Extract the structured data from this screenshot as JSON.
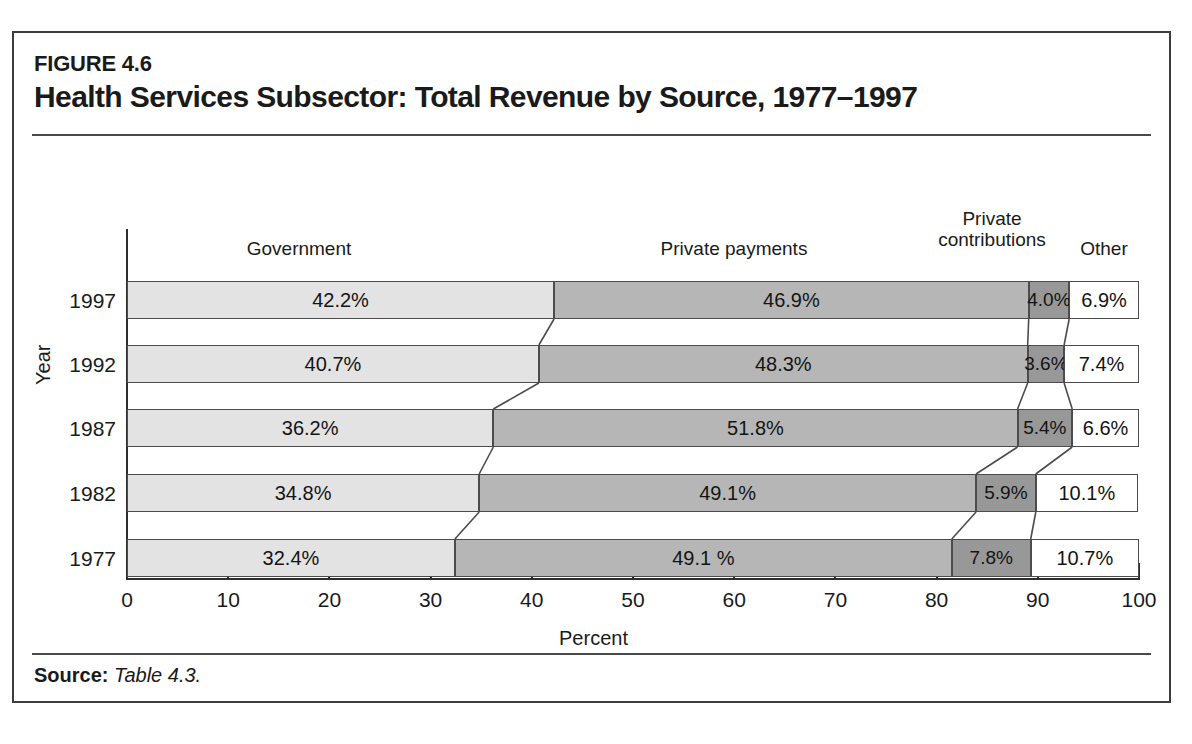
{
  "figure": {
    "label": "FIGURE 4.6",
    "title": "Health Services Subsector: Total Revenue by Source, 1977–1997",
    "source_prefix": "Source:",
    "source_text": "Table 4.3."
  },
  "chart_data": {
    "type": "bar",
    "orientation": "horizontal",
    "stacked": true,
    "title": "Health Services Subsector: Total Revenue by Source, 1977–1997",
    "xlabel": "Percent",
    "ylabel": "Year",
    "xlim": [
      0,
      100
    ],
    "xticks": [
      0,
      10,
      20,
      30,
      40,
      50,
      60,
      70,
      80,
      90,
      100
    ],
    "xtick_labels": [
      "0",
      "10",
      "20",
      "30",
      "40",
      "50",
      "60",
      "70",
      "80",
      "90",
      "100"
    ],
    "grid": false,
    "legend": "column-headers-above-plot",
    "categories": [
      "1997",
      "1992",
      "1987",
      "1982",
      "1977"
    ],
    "series": [
      {
        "name": "Government",
        "color": "#e3e3e3",
        "values": [
          42.2,
          40.7,
          36.2,
          34.8,
          32.4
        ],
        "labels": [
          "42.2%",
          "40.7%",
          "36.2%",
          "34.8%",
          "32.4%"
        ]
      },
      {
        "name": "Private payments",
        "color": "#b6b6b6",
        "values": [
          46.9,
          48.3,
          51.8,
          49.1,
          49.1
        ],
        "labels": [
          "46.9%",
          "48.3%",
          "51.8%",
          "49.1%",
          "49.1 %"
        ]
      },
      {
        "name": "Private contributions",
        "color": "#989898",
        "values": [
          4.0,
          3.6,
          5.4,
          5.9,
          7.8
        ],
        "labels": [
          "4.0%",
          "3.6%",
          "5.4%",
          "5.9%",
          "7.8%"
        ]
      },
      {
        "name": "Other",
        "color": "#ffffff",
        "values": [
          6.9,
          7.4,
          6.6,
          10.1,
          10.7
        ],
        "labels": [
          "6.9%",
          "7.4%",
          "6.6%",
          "10.1%",
          "10.7%"
        ]
      }
    ],
    "column_headers": [
      "Government",
      "Private payments",
      "Private\ncontributions",
      "Other"
    ]
  },
  "headers": {
    "government": "Government",
    "private_payments": "Private payments",
    "private_contributions_line1": "Private",
    "private_contributions_line2": "contributions",
    "other": "Other"
  }
}
